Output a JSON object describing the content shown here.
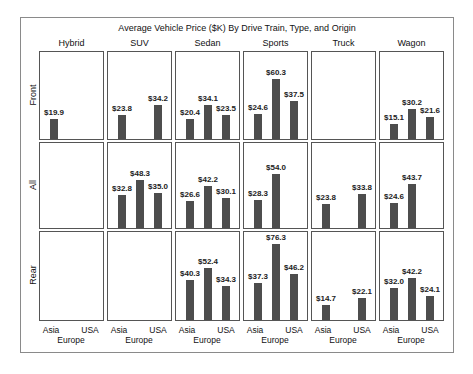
{
  "chart_data": {
    "type": "bar",
    "title": "Average Vehicle Price ($K) By Drive Train, Type, and Origin",
    "layout": "panel grid (rows = drive train, columns = vehicle type)",
    "columns": [
      "Hybrid",
      "SUV",
      "Sedan",
      "Sports",
      "Truck",
      "Wagon"
    ],
    "rows": [
      "Front",
      "All",
      "Rear"
    ],
    "categories": [
      "Asia",
      "Europe",
      "USA"
    ],
    "xlabel": "",
    "ylabel": "",
    "grid": false,
    "value_format": "$0.0",
    "panels": {
      "Front": {
        "Hybrid": {
          "Asia": 19.9,
          "Europe": null,
          "USA": null
        },
        "SUV": {
          "Asia": 23.8,
          "Europe": null,
          "USA": 34.2
        },
        "Sedan": {
          "Asia": 20.4,
          "Europe": 34.1,
          "USA": 23.5
        },
        "Sports": {
          "Asia": 24.6,
          "Europe": 60.3,
          "USA": 37.5
        },
        "Truck": {
          "Asia": null,
          "Europe": null,
          "USA": null
        },
        "Wagon": {
          "Asia": 15.1,
          "Europe": 30.2,
          "USA": 21.6
        }
      },
      "All": {
        "Hybrid": {
          "Asia": null,
          "Europe": null,
          "USA": null
        },
        "SUV": {
          "Asia": 32.8,
          "Europe": 48.3,
          "USA": 35.0
        },
        "Sedan": {
          "Asia": 26.6,
          "Europe": 42.2,
          "USA": 30.1
        },
        "Sports": {
          "Asia": 28.3,
          "Europe": 54.0,
          "USA": null
        },
        "Truck": {
          "Asia": 23.8,
          "Europe": null,
          "USA": 33.8
        },
        "Wagon": {
          "Asia": 24.6,
          "Europe": 43.7,
          "USA": null
        }
      },
      "Rear": {
        "Hybrid": {
          "Asia": null,
          "Europe": null,
          "USA": null
        },
        "SUV": {
          "Asia": null,
          "Europe": null,
          "USA": null
        },
        "Sedan": {
          "Asia": 40.3,
          "Europe": 52.4,
          "USA": 34.3
        },
        "Sports": {
          "Asia": 37.3,
          "Europe": 76.3,
          "USA": 46.2
        },
        "Truck": {
          "Asia": 14.7,
          "Europe": null,
          "USA": 22.1
        },
        "Wagon": {
          "Asia": 32.0,
          "Europe": 42.2,
          "USA": 24.1
        }
      }
    },
    "x_tick_labels": {
      "top_line": [
        "Asia",
        "USA"
      ],
      "bottom_line": [
        "Europe"
      ]
    },
    "bar_color": "#4d4d4d",
    "ylim": [
      0,
      85
    ]
  },
  "colors": {
    "bar": "#4d4d4d",
    "panel_border": "#555555",
    "frame_border": "#8a8a8a",
    "background": "#ffffff"
  }
}
